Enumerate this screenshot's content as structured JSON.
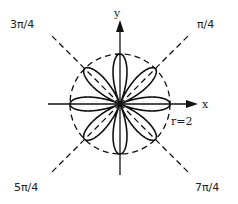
{
  "diagram": {
    "curve": {
      "equation": "r = 2cos(4θ)",
      "amplitude": 2,
      "k": 4,
      "petals": 8
    },
    "circle": {
      "radius": 2,
      "label": "r=2"
    },
    "axes": {
      "x_label": "x",
      "y_label": "y"
    },
    "angle_lines": [
      {
        "angle_rad": 0.7853981634,
        "label": "π/4"
      },
      {
        "angle_rad": 2.3561944902,
        "label": "3π/4"
      },
      {
        "angle_rad": 3.926990817,
        "label": "5π/4"
      },
      {
        "angle_rad": 5.4977871438,
        "label": "7π/4"
      }
    ],
    "colors": {
      "ink": "#111111",
      "background": "#ffffff"
    }
  }
}
